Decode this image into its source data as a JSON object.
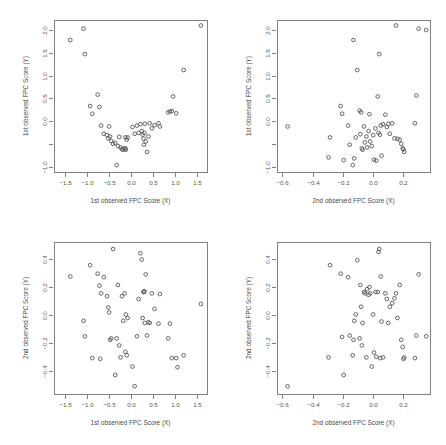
{
  "figure": {
    "type": "scatter-matrix",
    "panel_count": 4,
    "background_color": "#ffffff",
    "frame_color": "#808080",
    "point_color": "#555555",
    "point_symbol": "open-circle"
  },
  "chart_data": [
    {
      "id": "top-left",
      "type": "scatter",
      "title": "",
      "xlabel": "1st observed FPC Score (X)",
      "ylabel": "1st observed FPC Score (Y)",
      "xlim": [
        -1.75,
        1.72
      ],
      "ylim": [
        -1.12,
        2.22
      ],
      "xticks": [
        -1.5,
        -1.0,
        -0.5,
        0.0,
        0.5,
        1.0,
        1.5
      ],
      "xticklabels": [
        "-1.5",
        "-1.0",
        "-0.5",
        "0.0",
        "0.5",
        "1.0",
        "1.5"
      ],
      "yticks": [
        -1.0,
        -0.5,
        0.0,
        0.5,
        1.0,
        1.5,
        2.0
      ],
      "yticklabels": [
        "-1.0",
        "",
        "0.0",
        "0.5",
        "1.0",
        "1.5",
        "2.0"
      ],
      "grid": false,
      "legend": false,
      "x": [
        -1.38,
        -1.08,
        -1.05,
        -0.93,
        -0.88,
        -0.76,
        -0.72,
        -0.68,
        -0.62,
        -0.55,
        -0.52,
        -0.5,
        -0.48,
        -0.45,
        -0.41,
        -0.36,
        -0.33,
        -0.3,
        -0.27,
        -0.24,
        -0.21,
        -0.18,
        -0.15,
        -0.13,
        -0.13,
        -0.12,
        -0.1,
        -0.08,
        0.03,
        0.08,
        0.13,
        0.17,
        0.21,
        0.24,
        0.26,
        0.28,
        0.29,
        0.3,
        0.31,
        0.33,
        0.36,
        0.39,
        0.42,
        0.47,
        0.53,
        0.62,
        0.65,
        0.84,
        0.88,
        0.92,
        0.95,
        1.02,
        1.19,
        1.58
      ],
      "y": [
        1.78,
        2.03,
        1.47,
        0.33,
        0.16,
        0.58,
        0.31,
        -0.1,
        -0.28,
        -0.31,
        -0.38,
        -0.12,
        -0.34,
        -0.44,
        -0.5,
        -0.48,
        -0.97,
        -0.55,
        -0.35,
        -0.58,
        -0.62,
        -0.63,
        -0.6,
        -0.6,
        -0.36,
        -0.63,
        -0.41,
        -0.36,
        -0.13,
        -0.28,
        -0.1,
        -0.26,
        -0.07,
        -0.22,
        -0.3,
        -0.39,
        -0.52,
        -0.26,
        -0.06,
        -0.45,
        -0.68,
        -0.34,
        -0.05,
        -0.16,
        -0.09,
        -0.05,
        -0.12,
        0.19,
        0.21,
        0.22,
        0.54,
        0.17,
        1.12,
        2.1
      ]
    },
    {
      "id": "top-right",
      "type": "scatter",
      "title": "",
      "xlabel": "2nd observed FPC Score (X)",
      "ylabel": "1st observed FPC Score (Y)",
      "xlim": [
        -0.635,
        0.375
      ],
      "ylim": [
        -1.12,
        2.22
      ],
      "xticks": [
        -0.6,
        -0.4,
        -0.2,
        0.0,
        0.2
      ],
      "xticklabels": [
        "-0.6",
        "-0.4",
        "-0.2",
        "0.0",
        "0.2"
      ],
      "yticks": [
        -1.0,
        -0.5,
        0.0,
        0.5,
        1.0,
        1.5,
        2.0
      ],
      "yticklabels": [
        "-1.0",
        "",
        "0.0",
        "0.5",
        "1.0",
        "1.5",
        "2.0"
      ],
      "grid": false,
      "legend": false,
      "x": [
        -0.565,
        -0.295,
        -0.285,
        -0.215,
        -0.205,
        -0.195,
        -0.165,
        -0.155,
        -0.135,
        -0.13,
        -0.125,
        -0.115,
        -0.105,
        -0.09,
        -0.085,
        -0.08,
        -0.075,
        -0.07,
        -0.06,
        -0.055,
        -0.045,
        -0.04,
        -0.03,
        -0.025,
        -0.02,
        -0.01,
        0.0,
        0.005,
        0.015,
        0.02,
        0.03,
        0.035,
        0.04,
        0.045,
        0.05,
        0.055,
        0.065,
        0.08,
        0.09,
        0.1,
        0.11,
        0.125,
        0.14,
        0.15,
        0.16,
        0.175,
        0.185,
        0.195,
        0.2,
        0.205,
        0.275,
        0.285,
        0.3,
        0.35
      ],
      "y": [
        -0.12,
        -0.8,
        -0.36,
        0.33,
        0.16,
        -0.86,
        -0.1,
        -0.52,
        -0.97,
        1.78,
        -0.82,
        -0.36,
        1.12,
        0.23,
        -0.29,
        0.19,
        -0.6,
        -0.63,
        -0.12,
        -0.47,
        -0.34,
        -0.58,
        -0.22,
        0.15,
        -0.45,
        -0.55,
        -0.31,
        -0.85,
        -0.16,
        -0.87,
        0.54,
        -0.26,
        1.47,
        -0.3,
        -0.1,
        -0.76,
        -0.07,
        0.14,
        -0.13,
        -0.06,
        -0.28,
        -0.05,
        -0.38,
        2.1,
        -0.39,
        -0.41,
        -0.5,
        -0.6,
        -0.62,
        -0.68,
        -0.05,
        0.56,
        2.03,
        2.0
      ]
    },
    {
      "id": "bottom-left",
      "type": "scatter",
      "title": "",
      "xlabel": "1st observed FPC Score (X)",
      "ylabel": "2nd observed FPC Score (Y)",
      "xlim": [
        -1.75,
        1.72
      ],
      "ylim": [
        -0.56,
        0.52
      ],
      "xticks": [
        -1.5,
        -1.0,
        -0.5,
        0.0,
        0.5,
        1.0,
        1.5
      ],
      "xticklabels": [
        "-1.5",
        "-1.0",
        "-0.5",
        "0.0",
        "0.5",
        "1.0",
        "1.5"
      ],
      "yticks": [
        -0.4,
        -0.2,
        0.0,
        0.2,
        0.4
      ],
      "yticklabels": [
        "-0.4",
        "-0.2",
        "0.0",
        "0.2",
        "0.4"
      ],
      "grid": false,
      "legend": false,
      "x": [
        -1.38,
        -1.08,
        -1.05,
        -0.93,
        -0.88,
        -0.76,
        -0.72,
        -0.7,
        -0.68,
        -0.62,
        -0.55,
        -0.52,
        -0.5,
        -0.48,
        -0.45,
        -0.41,
        -0.36,
        -0.33,
        -0.3,
        -0.27,
        -0.24,
        -0.21,
        -0.18,
        -0.15,
        -0.13,
        -0.12,
        -0.1,
        -0.08,
        0.03,
        0.08,
        0.13,
        0.17,
        0.21,
        0.24,
        0.26,
        0.28,
        0.29,
        0.3,
        0.31,
        0.33,
        0.36,
        0.39,
        0.42,
        0.47,
        0.53,
        0.62,
        0.65,
        0.84,
        0.88,
        0.92,
        1.02,
        1.05,
        1.19,
        1.58
      ],
      "y": [
        0.275,
        -0.04,
        -0.15,
        0.355,
        -0.305,
        0.295,
        0.21,
        -0.31,
        0.155,
        0.27,
        0.135,
        0.055,
        0.02,
        -0.175,
        -0.165,
        0.47,
        -0.425,
        -0.165,
        0.215,
        -0.215,
        -0.3,
        0.135,
        -0.04,
        0.155,
        -0.26,
        0.005,
        -0.285,
        -0.02,
        -0.365,
        -0.505,
        -0.15,
        0.115,
        0.44,
        0.395,
        -0.02,
        0.165,
        0.165,
        0.17,
        -0.055,
        0.29,
        -0.145,
        -0.05,
        -0.055,
        0.155,
        0.045,
        -0.06,
        0.15,
        -0.165,
        -0.06,
        -0.305,
        -0.305,
        -0.37,
        -0.285,
        0.08
      ]
    },
    {
      "id": "bottom-right",
      "type": "scatter",
      "title": "",
      "xlabel": "2nd observed FPC Score (X)",
      "ylabel": "2nd observed FPC Score (Y)",
      "xlim": [
        -0.635,
        0.375
      ],
      "ylim": [
        -0.56,
        0.52
      ],
      "xticks": [
        -0.6,
        -0.4,
        -0.2,
        0.0,
        0.2
      ],
      "xticklabels": [
        "-0.6",
        "-0.4",
        "-0.2",
        "0.0",
        "0.2"
      ],
      "yticks": [
        -0.4,
        -0.2,
        0.0,
        0.2,
        0.4
      ],
      "yticklabels": [
        "-0.4",
        "-0.2",
        "0.0",
        "0.2",
        "0.4"
      ],
      "grid": false,
      "legend": false,
      "x": [
        -0.565,
        -0.295,
        -0.285,
        -0.215,
        -0.205,
        -0.195,
        -0.165,
        -0.155,
        -0.135,
        -0.13,
        -0.125,
        -0.115,
        -0.105,
        -0.09,
        -0.085,
        -0.08,
        -0.075,
        -0.07,
        -0.06,
        -0.055,
        -0.045,
        -0.04,
        -0.03,
        -0.025,
        -0.02,
        -0.01,
        0.0,
        0.005,
        0.015,
        0.02,
        0.03,
        0.035,
        0.04,
        0.045,
        0.05,
        0.055,
        0.065,
        0.08,
        0.09,
        0.1,
        0.11,
        0.125,
        0.14,
        0.15,
        0.16,
        0.175,
        0.185,
        0.195,
        0.2,
        0.205,
        0.275,
        0.285,
        0.3,
        0.35
      ],
      "y": [
        -0.505,
        -0.3,
        0.355,
        0.295,
        -0.155,
        -0.425,
        0.27,
        -0.145,
        -0.285,
        -0.175,
        -0.04,
        0.005,
        0.39,
        -0.165,
        0.215,
        0.06,
        -0.215,
        -0.055,
        0.165,
        0.155,
        -0.3,
        0.185,
        0.145,
        0.2,
        0.155,
        -0.365,
        0.005,
        -0.265,
        0.165,
        -0.295,
        0.165,
        0.45,
        0.47,
        -0.305,
        0.275,
        -0.045,
        -0.3,
        0.155,
        0.115,
        -0.055,
        0.06,
        0.085,
        0.12,
        0.155,
        -0.02,
        0.215,
        -0.175,
        -0.225,
        -0.31,
        -0.3,
        -0.305,
        -0.145,
        0.29,
        -0.15
      ]
    }
  ]
}
